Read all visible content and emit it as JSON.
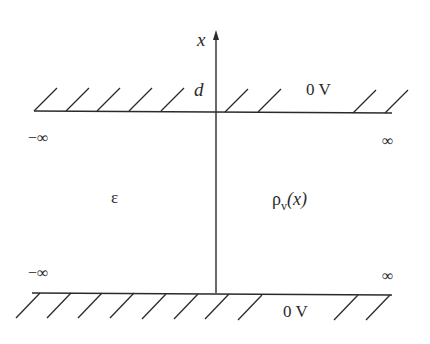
{
  "diagram": {
    "axis_label": "x",
    "top_plate": {
      "position_label": "d",
      "potential": "0 V"
    },
    "bottom_plate": {
      "potential": "0 V"
    },
    "left_limits": [
      "−∞",
      "−∞"
    ],
    "right_limits": [
      "∞",
      "∞"
    ],
    "permittivity": "ε",
    "charge_density": {
      "symbol": "ρ",
      "subscript": "v",
      "argument": "(x)"
    },
    "colors": {
      "line": "#2a2a2a",
      "background": "#ffffff"
    }
  }
}
